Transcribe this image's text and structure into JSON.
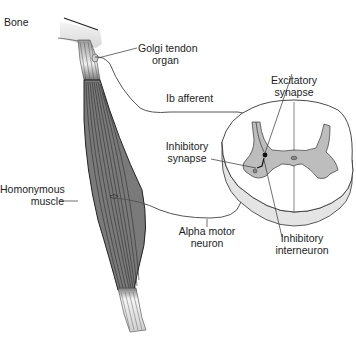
{
  "diagram": {
    "type": "anatomical-illustration",
    "labels": {
      "bone": "Bone",
      "golgi_tendon_organ": [
        "Golgi tendon",
        "organ"
      ],
      "ib_afferent": "Ib afferent",
      "excitatory_synapse": [
        "Excitatory",
        "synapse"
      ],
      "inhibitory_synapse": [
        "Inhibitory",
        "synapse"
      ],
      "homonymous_muscle": [
        "Homonymous",
        "muscle"
      ],
      "alpha_motor_neuron": [
        "Alpha motor",
        "neuron"
      ],
      "inhibitory_interneuron": [
        "Inhibitory",
        "interneuron"
      ]
    },
    "colors": {
      "muscle": "#7a7a7a",
      "muscle_stripes": "#333333",
      "tendon": "#e6e6e6",
      "gray_matter": "#bdbdbd",
      "white_matter": "#ffffff",
      "cord_side": "#e4e4e4",
      "outline": "#333333",
      "nerve": "#555555"
    }
  }
}
